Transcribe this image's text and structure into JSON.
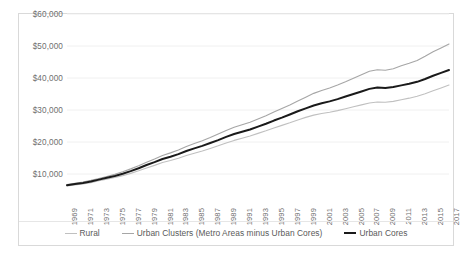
{
  "chart_data": {
    "type": "line",
    "title": "",
    "subtitle": "",
    "xlabel": "",
    "ylabel": "",
    "grid": true,
    "legend_position": "bottom",
    "ylim": [
      0,
      60000
    ],
    "y_ticks": [
      10000,
      20000,
      30000,
      40000,
      50000,
      60000
    ],
    "y_tick_labels": [
      "$10,000",
      "$20,000",
      "$30,000",
      "$40,000",
      "$50,000",
      "$60,000"
    ],
    "x_tick_labels": [
      "1969",
      "1971",
      "1973",
      "1975",
      "1977",
      "1979",
      "1981",
      "1983",
      "1985",
      "1987",
      "1989",
      "1991",
      "1993",
      "1995",
      "1997",
      "1999",
      "2001",
      "2003",
      "2005",
      "2007",
      "2009",
      "2011",
      "2013",
      "2015",
      "2017"
    ],
    "x": [
      1969,
      1970,
      1971,
      1972,
      1973,
      1974,
      1975,
      1976,
      1977,
      1978,
      1979,
      1980,
      1981,
      1982,
      1983,
      1984,
      1985,
      1986,
      1987,
      1988,
      1989,
      1990,
      1991,
      1992,
      1993,
      1994,
      1995,
      1996,
      1997,
      1998,
      1999,
      2000,
      2001,
      2002,
      2003,
      2004,
      2005,
      2006,
      2007,
      2008,
      2009,
      2010,
      2011,
      2012,
      2013,
      2014,
      2015,
      2016,
      2017
    ],
    "series": [
      {
        "name": "Rural",
        "color": "#c0c0c0",
        "width": 1.1,
        "values": [
          6300,
          6600,
          6900,
          7300,
          7900,
          8400,
          8900,
          9500,
          10200,
          11000,
          11900,
          12700,
          13600,
          14200,
          14900,
          15800,
          16500,
          17200,
          18000,
          18800,
          19700,
          20500,
          21200,
          21900,
          22700,
          23500,
          24400,
          25200,
          26000,
          26900,
          27700,
          28400,
          28900,
          29300,
          29800,
          30400,
          31000,
          31600,
          32200,
          32500,
          32400,
          32700,
          33200,
          33700,
          34300,
          35100,
          36000,
          36900,
          37800
        ]
      },
      {
        "name": "Urban Clusters (Metro Areas minus Urban Cores)",
        "color": "#a6a6a6",
        "width": 1.1,
        "values": [
          6700,
          7100,
          7500,
          8000,
          8600,
          9200,
          9900,
          10700,
          11600,
          12600,
          13700,
          14700,
          15800,
          16600,
          17500,
          18600,
          19500,
          20400,
          21400,
          22500,
          23600,
          24600,
          25400,
          26200,
          27200,
          28200,
          29400,
          30500,
          31600,
          32800,
          34000,
          35200,
          36100,
          36900,
          37800,
          38800,
          39900,
          41000,
          42100,
          42600,
          42400,
          42900,
          43800,
          44600,
          45500,
          46800,
          48200,
          49400,
          50600
        ]
      },
      {
        "name": "Urban Cores",
        "color": "#1a1a1a",
        "width": 2.0,
        "values": [
          6500,
          6850,
          7200,
          7650,
          8250,
          8800,
          9400,
          10100,
          10900,
          11800,
          12800,
          13700,
          14700,
          15400,
          16200,
          17200,
          18000,
          18800,
          19700,
          20600,
          21600,
          22500,
          23200,
          23900,
          24800,
          25700,
          26700,
          27600,
          28600,
          29600,
          30500,
          31400,
          32100,
          32700,
          33400,
          34200,
          35000,
          35800,
          36600,
          37000,
          36900,
          37200,
          37700,
          38200,
          38800,
          39700,
          40700,
          41600,
          42500
        ]
      }
    ]
  },
  "legend": {
    "items": [
      {
        "label": "Rural",
        "color": "#c0c0c0",
        "thickness": "1px"
      },
      {
        "label": "Urban Clusters (Metro Areas minus Urban Cores)",
        "color": "#a6a6a6",
        "thickness": "1px"
      },
      {
        "label": "Urban Cores",
        "color": "#1a1a1a",
        "thickness": "2px"
      }
    ]
  },
  "colors": {
    "card_border": "#d9d9d9",
    "gridline": "#f0f0f0",
    "tick_text": "#6f6f6f",
    "background": "#ffffff"
  }
}
